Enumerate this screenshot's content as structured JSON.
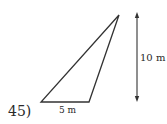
{
  "problem": {
    "number": "45)",
    "base_label": "5 m",
    "height_label": "10 m"
  },
  "figure": {
    "shape": "obtuse triangle",
    "base": 5,
    "height": 10,
    "unit": "m",
    "stroke_color": "#333333"
  }
}
